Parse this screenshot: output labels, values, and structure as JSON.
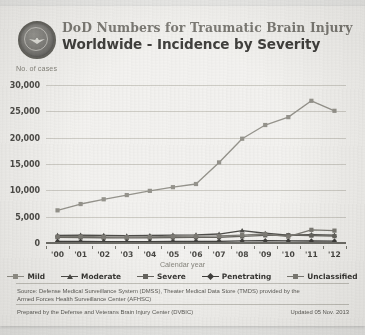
{
  "header": {
    "logo_name": "dod-seal",
    "title_line1": "DoD Numbers for Traumatic Brain Injury",
    "title_line2": "Worldwide - Incidence by Severity"
  },
  "footer": {
    "source": "Source: Defense Medical Surveillance System (DMSS), Theater Medical Data Store (TMDS) provided by the Armed Forces Health Surveillance Center (AFHSC)",
    "prepared_by": "Prepared by the Defense and Veterans Brain Injury Center (DVBIC)",
    "updated": "Updated 05 Nov. 2013"
  },
  "colors": {
    "mild": "#8a8880",
    "moderate": "#3a3935",
    "severe": "#56544e",
    "penetrating": "#2b2a27",
    "unclassified": "#6f6d66",
    "grid": "#c9c7c0",
    "axis": "#5f5e58",
    "title_gray": "#6e6c66",
    "title_dark": "#2c2b28",
    "paper": "#f2f1ee"
  },
  "chart_data": {
    "type": "line",
    "xlabel": "Calendar year",
    "ylabel": "No. of cases",
    "grid": true,
    "legend_position": "bottom",
    "ylim": [
      0,
      30000
    ],
    "yticks": [
      0,
      5000,
      10000,
      15000,
      20000,
      25000,
      30000
    ],
    "ytick_labels": [
      "0",
      "5,000",
      "10,000",
      "15,000",
      "20,000",
      "25,000",
      "30,000"
    ],
    "categories": [
      "'00",
      "'01",
      "'02",
      "'03",
      "'04",
      "'05",
      "'06",
      "'07",
      "'08",
      "'09",
      "'10",
      "'11",
      "'12"
    ],
    "series": [
      {
        "name": "Mild",
        "color": "#8a8880",
        "marker": "square",
        "values": [
          6200,
          7400,
          8300,
          9100,
          9900,
          10600,
          11200,
          15300,
          19800,
          22400,
          23900,
          27000,
          25100
        ]
      },
      {
        "name": "Moderate",
        "color": "#3a3935",
        "marker": "triangle",
        "values": [
          1450,
          1500,
          1450,
          1380,
          1420,
          1500,
          1550,
          1700,
          2350,
          1850,
          1500,
          1600,
          1500
        ]
      },
      {
        "name": "Severe",
        "color": "#56544e",
        "marker": "square",
        "values": [
          1100,
          1050,
          1000,
          980,
          1000,
          1050,
          1080,
          1100,
          1250,
          1450,
          1500,
          1400,
          1300
        ]
      },
      {
        "name": "Penetrating",
        "color": "#2b2a27",
        "marker": "diamond",
        "values": [
          300,
          280,
          260,
          250,
          260,
          280,
          300,
          320,
          400,
          420,
          400,
          380,
          350
        ]
      },
      {
        "name": "Unclassified",
        "color": "#6f6d66",
        "marker": "square",
        "values": [
          1200,
          1250,
          1150,
          1100,
          1150,
          1250,
          1300,
          1350,
          1500,
          1700,
          1200,
          2500,
          2350
        ]
      }
    ]
  }
}
